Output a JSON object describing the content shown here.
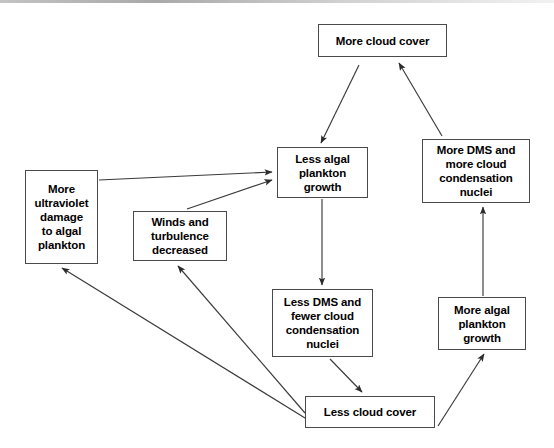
{
  "diagram": {
    "style": {
      "box_border_color": "#4a4a4a",
      "arrow_color": "#3a3a3a",
      "background": "#ffffff",
      "text_color": "#000000"
    },
    "nodes": [
      {
        "id": "more-cloud-cover",
        "label": "More cloud cover",
        "x": 318,
        "y": 24,
        "w": 129,
        "h": 33
      },
      {
        "id": "less-algal-plankton-growth",
        "label": "Less algal\nplankton\ngrowth",
        "x": 277,
        "y": 147,
        "w": 91,
        "h": 51
      },
      {
        "id": "more-dms-more-nuclei",
        "label": "More DMS and\nmore cloud\ncondensation\nnuclei",
        "x": 422,
        "y": 139,
        "w": 108,
        "h": 64
      },
      {
        "id": "more-uv-damage",
        "label": "More\nultraviolet\ndamage\nto algal\nplankton",
        "x": 25,
        "y": 170,
        "w": 73,
        "h": 94
      },
      {
        "id": "winds-turbulence-decreased",
        "label": "Winds and\nturbulence\ndecreased",
        "x": 133,
        "y": 211,
        "w": 94,
        "h": 50
      },
      {
        "id": "less-dms-fewer-nuclei",
        "label": "Less DMS and\nfewer cloud\ncondensation\nnuclei",
        "x": 272,
        "y": 289,
        "w": 101,
        "h": 68
      },
      {
        "id": "more-algal-plankton-growth",
        "label": "More algal\nplankton\ngrowth",
        "x": 438,
        "y": 297,
        "w": 88,
        "h": 53
      },
      {
        "id": "less-cloud-cover",
        "label": "Less cloud cover",
        "x": 305,
        "y": 396,
        "w": 130,
        "h": 32
      }
    ],
    "edges": [
      {
        "id": "edge-more-cloud-to-less-algal",
        "from": "more-cloud-cover",
        "to": "less-algal-plankton-growth",
        "x1": 359,
        "y1": 65,
        "x2": 321,
        "y2": 143
      },
      {
        "id": "edge-more-dms-to-more-cloud",
        "from": "more-dms-more-nuclei",
        "to": "more-cloud-cover",
        "x1": 442,
        "y1": 136,
        "x2": 399,
        "y2": 63
      },
      {
        "id": "edge-more-uv-to-less-algal",
        "from": "more-uv-damage",
        "to": "less-algal-plankton-growth",
        "x1": 99,
        "y1": 180,
        "x2": 272,
        "y2": 172
      },
      {
        "id": "edge-winds-to-less-algal",
        "from": "winds-turbulence-decreased",
        "to": "less-algal-plankton-growth",
        "x1": 187,
        "y1": 209,
        "x2": 272,
        "y2": 180
      },
      {
        "id": "edge-less-algal-to-less-dms",
        "from": "less-algal-plankton-growth",
        "to": "less-dms-fewer-nuclei",
        "x1": 322,
        "y1": 199,
        "x2": 322,
        "y2": 285
      },
      {
        "id": "edge-less-dms-to-less-cloud",
        "from": "less-dms-fewer-nuclei",
        "to": "less-cloud-cover",
        "x1": 330,
        "y1": 359,
        "x2": 362,
        "y2": 392
      },
      {
        "id": "edge-less-cloud-to-more-algal",
        "from": "less-cloud-cover",
        "to": "more-algal-plankton-growth",
        "x1": 438,
        "y1": 426,
        "x2": 484,
        "y2": 354
      },
      {
        "id": "edge-more-algal-to-more-dms",
        "from": "more-algal-plankton-growth",
        "to": "more-dms-more-nuclei",
        "x1": 483,
        "y1": 296,
        "x2": 483,
        "y2": 207
      },
      {
        "id": "edge-less-cloud-to-more-uv",
        "from": "less-cloud-cover",
        "to": "more-uv-damage",
        "x1": 305,
        "y1": 418,
        "x2": 62,
        "y2": 268
      },
      {
        "id": "edge-less-cloud-to-winds",
        "from": "less-cloud-cover",
        "to": "winds-turbulence-decreased",
        "x1": 305,
        "y1": 413,
        "x2": 178,
        "y2": 266
      }
    ]
  }
}
